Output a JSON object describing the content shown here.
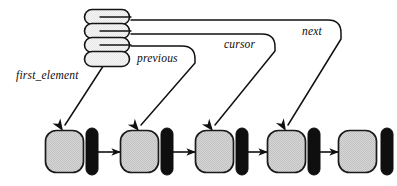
{
  "diagram": {
    "type": "linked-list-pointer-diagram",
    "title": "",
    "colors": {
      "stroke": "#121212",
      "node_fill": "#d3d3d3",
      "node_stroke": "#1a1a1a",
      "link_fill": "#0f0f0f",
      "stack_fill": "#f2f2f2",
      "background": "#ffffff"
    },
    "labels": [
      {
        "id": "first_element",
        "text": "first_element",
        "x": 16,
        "y": 76
      },
      {
        "id": "previous",
        "text": "previous",
        "x": 135,
        "y": 61
      },
      {
        "id": "cursor",
        "text": "cursor",
        "x": 222,
        "y": 48
      },
      {
        "id": "next",
        "text": "next",
        "x": 300,
        "y": 34
      }
    ],
    "stack": {
      "name": "pointer-record-stack",
      "x": 84,
      "y": 9,
      "width": 46,
      "height": 59,
      "layer_count": 4,
      "layers": [
        {
          "index": 0,
          "label": "next"
        },
        {
          "index": 1,
          "label": "cursor"
        },
        {
          "index": 2,
          "label": "previous"
        },
        {
          "index": 3,
          "label": "first_element"
        }
      ]
    },
    "nodes": [
      {
        "index": 0,
        "name": "list-node-1",
        "square_x": 45,
        "square_y": 130,
        "square_w": 39,
        "square_h": 43,
        "bar_x": 86,
        "bar_y": 128,
        "bar_w": 12,
        "bar_h": 47
      },
      {
        "index": 1,
        "name": "list-node-2",
        "square_x": 120,
        "square_y": 130,
        "square_w": 39,
        "square_h": 43,
        "bar_x": 161,
        "bar_y": 128,
        "bar_w": 12,
        "bar_h": 47
      },
      {
        "index": 2,
        "name": "list-node-3",
        "square_x": 195,
        "square_y": 130,
        "square_w": 39,
        "square_h": 43,
        "bar_x": 236,
        "bar_y": 128,
        "bar_w": 12,
        "bar_h": 47
      },
      {
        "index": 3,
        "name": "list-node-4",
        "square_x": 267,
        "square_y": 130,
        "square_w": 39,
        "square_h": 43,
        "bar_x": 308,
        "bar_y": 128,
        "bar_w": 12,
        "bar_h": 47
      },
      {
        "index": 4,
        "name": "list-node-5",
        "square_x": 338,
        "square_y": 130,
        "square_w": 39,
        "square_h": 43,
        "bar_x": 381,
        "bar_y": 128,
        "bar_w": 12,
        "bar_h": 47
      }
    ],
    "next_links": [
      {
        "from": 0,
        "to": 1,
        "x1": 98,
        "x2": 118,
        "y": 152
      },
      {
        "from": 1,
        "to": 2,
        "x1": 173,
        "x2": 193,
        "y": 152
      },
      {
        "from": 2,
        "to": 3,
        "x1": 248,
        "x2": 265,
        "y": 152
      },
      {
        "from": 3,
        "to": 4,
        "x1": 320,
        "x2": 336,
        "y": 152
      }
    ],
    "pointer_arrows": [
      {
        "id": "first_element-arrow",
        "label": "first_element",
        "target_node": 0,
        "path": "M 108 58 L 64 126",
        "arrow_x": 62,
        "arrow_y": 129,
        "arrow_angle": 57
      },
      {
        "id": "previous-arrow",
        "label": "previous",
        "target_node": 1,
        "path": "M 131 46 L 182 46 Q 194 46 194 58 L 194 62 L 140 126",
        "arrow_x": 138,
        "arrow_y": 129,
        "arrow_angle": 50
      },
      {
        "id": "cursor-arrow",
        "label": "cursor",
        "target_node": 2,
        "path": "M 131 34 L 262 34 Q 274 34 274 46 L 274 50 L 214 126",
        "arrow_x": 212,
        "arrow_y": 129,
        "arrow_angle": 52
      },
      {
        "id": "next-arrow",
        "label": "next",
        "target_node": 3,
        "path": "M 131 20 L 328 20 Q 340 20 340 32 L 340 38 L 287 126",
        "arrow_x": 285,
        "arrow_y": 129,
        "arrow_angle": 60
      }
    ]
  }
}
